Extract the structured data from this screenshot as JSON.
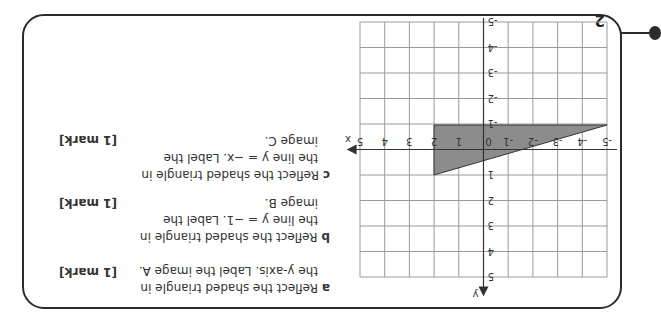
{
  "question_number": "2",
  "grid": {
    "x_ticks": [
      "-5",
      "-4",
      "-3",
      "-2",
      "-1",
      "0",
      "1",
      "2",
      "3",
      "4",
      "5"
    ],
    "y_ticks": [
      "-5",
      "-4",
      "-3",
      "-2",
      "-1",
      "1",
      "2",
      "3",
      "4",
      "5"
    ],
    "x_label": "x",
    "y_label": "y"
  },
  "parts": [
    {
      "letter": "a",
      "lines": [
        "Reflect the shaded triangle in",
        "the y-axis. Label the image A."
      ],
      "mark": "[1 mark]"
    },
    {
      "letter": "b",
      "lines": [
        "Reflect the shaded triangle in",
        "the line y = −1. Label the",
        "image B."
      ],
      "mark": "[1 mark]"
    },
    {
      "letter": "c",
      "lines": [
        "Reflect the shaded triangle in",
        "the line y = −x. Label the",
        "image C."
      ],
      "mark": "[1 mark]"
    }
  ],
  "colors": {
    "shade": "#8c8c8c",
    "grid": "#9a9a9a",
    "axis": "#333333"
  }
}
